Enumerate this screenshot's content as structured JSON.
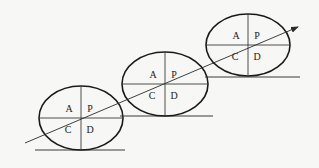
{
  "diagram": {
    "type": "pdca-cycle-staircase",
    "cycles": [
      {
        "id": "cycle-1",
        "center": [
          81,
          118
        ],
        "rx": 42,
        "ry": 32,
        "ground_y": 150,
        "ground_x": [
          35,
          125
        ],
        "labels": {
          "top_left": "A",
          "top_right": "P",
          "bottom_left": "C",
          "bottom_right": "D"
        }
      },
      {
        "id": "cycle-2",
        "center": [
          165,
          84
        ],
        "rx": 43,
        "ry": 32,
        "ground_y": 116,
        "ground_x": [
          120,
          213
        ],
        "labels": {
          "top_left": "A",
          "top_right": "P",
          "bottom_left": "C",
          "bottom_right": "D"
        }
      },
      {
        "id": "cycle-3",
        "center": [
          248,
          45
        ],
        "rx": 42,
        "ry": 31,
        "ground_y": 77,
        "ground_x": [
          205,
          300
        ],
        "labels": {
          "top_left": "A",
          "top_right": "P",
          "bottom_left": "C",
          "bottom_right": "D"
        }
      }
    ],
    "arrow": {
      "from": [
        25,
        143
      ],
      "to": [
        298,
        27
      ]
    },
    "colors": {
      "background": "#f7f7f6",
      "stroke": "#1a1a1a",
      "text": "#222222"
    }
  }
}
